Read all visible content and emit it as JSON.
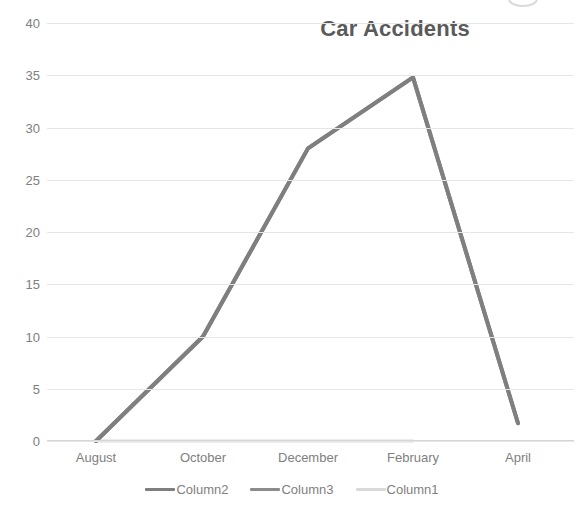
{
  "chart_data": {
    "type": "line",
    "title": "Car Accidents",
    "xlabel": "",
    "ylabel": "",
    "categories": [
      "August",
      "October",
      "December",
      "February",
      "April"
    ],
    "series": [
      {
        "name": "Column2",
        "values": [
          0,
          10,
          28,
          34.8,
          1.7
        ],
        "color": "#7f7f7f"
      },
      {
        "name": "Column3",
        "values": [
          0,
          10,
          28,
          34.8,
          1.7
        ],
        "color": "#8c8c8c"
      },
      {
        "name": "Column1",
        "values": [
          0,
          0,
          0,
          0,
          null
        ],
        "color": "#d9d9d9"
      }
    ],
    "ylim": [
      0,
      40
    ],
    "yticks": [
      0,
      5,
      10,
      15,
      20,
      25,
      30,
      35,
      40
    ],
    "ytick_labels": [
      "0",
      "5",
      "10",
      "15",
      "20",
      "25",
      "30",
      "35",
      "40"
    ],
    "grid": true,
    "legend_position": "bottom",
    "markers": false
  },
  "title": {
    "text": "Car Accidents"
  },
  "axes": {
    "y_tick_labels": [
      "40",
      "35",
      "30",
      "25",
      "20",
      "15",
      "10",
      "5",
      "0"
    ],
    "x_tick_labels": [
      "August",
      "October",
      "December",
      "February",
      "April"
    ]
  },
  "legend": {
    "items": [
      {
        "label": "Column2",
        "color": "#7f7f7f"
      },
      {
        "label": "Column3",
        "color": "#8c8c8c"
      },
      {
        "label": "Column1",
        "color": "#d9d9d9"
      }
    ]
  },
  "style": {
    "title_color": "#5a5a5a",
    "tick_color": "#808080",
    "grid_color": "#e6e6e6",
    "background": "#ffffff"
  }
}
